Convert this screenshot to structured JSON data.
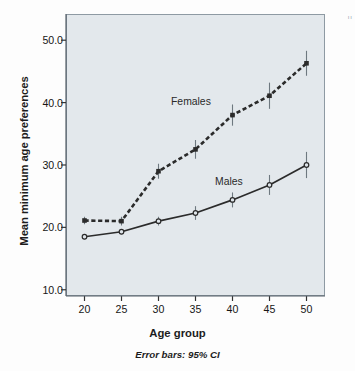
{
  "chart_data": {
    "type": "line",
    "title": "",
    "subtitle": "",
    "xlabel": "Age group",
    "ylabel": "Mean minimum age preferences",
    "caption": "Error bars: 95% CI",
    "x": [
      20,
      25,
      30,
      35,
      40,
      45,
      50
    ],
    "xticklabels": [
      "20",
      "25",
      "30",
      "35",
      "40",
      "45",
      "50"
    ],
    "yticks": [
      10.0,
      20.0,
      30.0,
      40.0,
      50.0
    ],
    "yticklabels": [
      "10.0",
      "20.0",
      "30.0",
      "40.0",
      "50.0"
    ],
    "xlim": [
      17.5,
      52.5
    ],
    "ylim": [
      9.0,
      54.2
    ],
    "grid": false,
    "legend": "inline-annotations",
    "error_bar_type": "95% CI",
    "series": [
      {
        "name": "Females",
        "linestyle": "dashed",
        "marker": "filled-square",
        "color": "#2b2b2b",
        "values": [
          21.1,
          21.0,
          29.0,
          32.5,
          38.0,
          41.1,
          46.3
        ],
        "ci_low": [
          20.5,
          20.3,
          27.8,
          31.0,
          36.3,
          39.0,
          44.3
        ],
        "ci_high": [
          21.7,
          21.7,
          30.2,
          34.0,
          39.7,
          43.2,
          48.3
        ],
        "annotation": "Females"
      },
      {
        "name": "Males",
        "linestyle": "solid",
        "marker": "open-circle",
        "color": "#2b2b2b",
        "values": [
          18.5,
          19.3,
          21.0,
          22.3,
          24.4,
          26.8,
          30.0
        ],
        "ci_low": [
          18.1,
          18.9,
          20.3,
          21.2,
          23.2,
          25.2,
          27.9
        ],
        "ci_high": [
          18.9,
          19.7,
          21.7,
          23.4,
          25.6,
          28.4,
          32.1
        ],
        "annotation": "Males"
      }
    ]
  },
  "figure": {
    "plot_background": "#e3e8ec",
    "page_background": "#fdfdfd",
    "axis_color": "#8e9aa3",
    "ink_color": "#2b2b2b",
    "corner_mark": "ıı"
  },
  "annotations": {
    "females_label": "Females",
    "males_label": "Males"
  }
}
